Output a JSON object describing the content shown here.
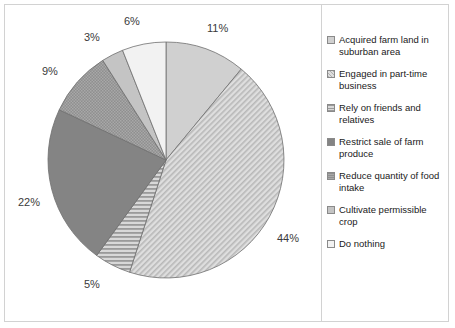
{
  "chart_data": {
    "type": "pie",
    "title": "",
    "subtitle": "",
    "xlabel": "",
    "ylabel": "",
    "grid": false,
    "legend_position": "right",
    "start_angle_deg": 0,
    "direction": "clockwise",
    "units": "percent",
    "categories": [
      "Acquired farm land in suburban area",
      "Engaged in part-time business",
      "Rely on friends and relatives",
      "Restrict sale of farm produce",
      "Reduce quantity of food intake",
      "Cultivate permissible crop",
      "Do nothing"
    ],
    "values": [
      11,
      44,
      5,
      22,
      9,
      3,
      6
    ],
    "data_labels": [
      "11%",
      "44%",
      "5%",
      "22%",
      "9%",
      "3%",
      "6%"
    ],
    "slices": [
      {
        "label": "Acquired farm land in suburban area",
        "value": 11,
        "data_label": "11%",
        "fill": "#d0d0d0",
        "pattern": "solid",
        "start_deg": 0,
        "end_deg": 39.6
      },
      {
        "label": "Engaged in part-time business",
        "value": 44,
        "data_label": "44%",
        "fill": "#d3d3d3",
        "pattern": "diagonal-fine",
        "start_deg": 39.6,
        "end_deg": 198.0
      },
      {
        "label": "Rely on friends and relatives",
        "value": 5,
        "data_label": "5%",
        "fill": "#b4b4b4",
        "pattern": "horizontal-lines",
        "start_deg": 198.0,
        "end_deg": 216.0
      },
      {
        "label": "Restrict sale of farm produce",
        "value": 22,
        "data_label": "22%",
        "fill": "#848484",
        "pattern": "solid",
        "start_deg": 216.0,
        "end_deg": 295.2
      },
      {
        "label": "Reduce quantity of food intake",
        "value": 9,
        "data_label": "9%",
        "fill": "#8c8c8c",
        "pattern": "cross-hatch",
        "start_deg": 295.2,
        "end_deg": 327.6
      },
      {
        "label": "Cultivate permissible crop",
        "value": 3,
        "data_label": "3%",
        "fill": "#c4c4c4",
        "pattern": "solid",
        "start_deg": 327.6,
        "end_deg": 338.4
      },
      {
        "label": "Do nothing",
        "value": 6,
        "data_label": "6%",
        "fill": "#f2f2f2",
        "pattern": "solid",
        "start_deg": 338.4,
        "end_deg": 360.0
      }
    ]
  },
  "labels": {
    "pct_11": "11%",
    "pct_44": "44%",
    "pct_5": "5%",
    "pct_22": "22%",
    "pct_9": "9%",
    "pct_3": "3%",
    "pct_6": "6%"
  },
  "legend": {
    "items": [
      {
        "label": "Acquired farm land in suburban area"
      },
      {
        "label": "Engaged in part-time business"
      },
      {
        "label": "Rely on friends and relatives"
      },
      {
        "label": "Restrict sale of farm produce"
      },
      {
        "label": "Reduce quantity of food intake"
      },
      {
        "label": "Cultivate permissible crop"
      },
      {
        "label": "Do nothing"
      }
    ]
  },
  "colors": {
    "border": "#d2d2d2",
    "outline": "#6e6e6e",
    "text": "#1a1a1a",
    "label_text": "#3a3a3a",
    "background": "#ffffff"
  }
}
